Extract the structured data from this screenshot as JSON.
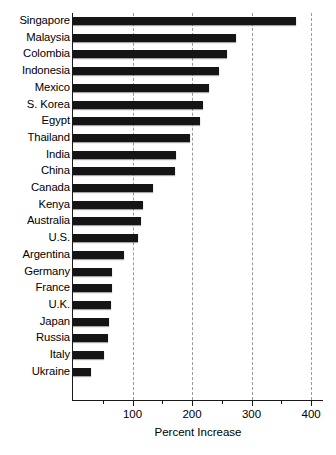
{
  "chart_data": {
    "type": "bar",
    "orientation": "horizontal",
    "title": "",
    "xlabel": "Percent Increase",
    "ylabel": "",
    "xlim": [
      0,
      420
    ],
    "ylim": null,
    "grid": "vertical-dashed",
    "legend": "none",
    "axis_ticks": {
      "major": [
        100,
        200,
        300,
        400
      ],
      "major_labels": [
        "100",
        "200",
        "300",
        "400"
      ],
      "minor": [
        50,
        150,
        250,
        350
      ]
    },
    "gridlines_at": [
      100,
      200,
      300,
      400
    ],
    "categories": [
      "Singapore",
      "Malaysia",
      "Colombia",
      "Indonesia",
      "Mexico",
      "S. Korea",
      "Egypt",
      "Thailand",
      "India",
      "China",
      "Canada",
      "Kenya",
      "Australia",
      "U.S.",
      "Argentina",
      "Germany",
      "France",
      "U.K.",
      "Japan",
      "Russia",
      "Italy",
      "Ukraine"
    ],
    "values": [
      375,
      273,
      259,
      246,
      228,
      219,
      214,
      197,
      173,
      172,
      134,
      118,
      115,
      110,
      85,
      66,
      66,
      64,
      60,
      58,
      52,
      31
    ],
    "bar_color": "#151515"
  }
}
